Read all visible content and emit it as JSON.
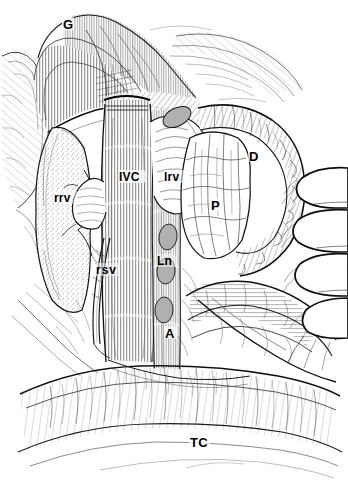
{
  "figure": {
    "kind": "anatomical-line-drawing",
    "background_color": "#ffffff",
    "ink_color": "#000000",
    "node_fill_color": "#b0b0b0",
    "width": 348,
    "height": 493
  },
  "labels": [
    {
      "id": "gonadal-or-gerota",
      "text": "G",
      "x": 66,
      "y": 25,
      "size": 13,
      "meaning": "retracted tissue flap"
    },
    {
      "id": "ivc",
      "text": "IVC",
      "x": 122,
      "y": 178,
      "size": 12,
      "meaning": "inferior vena cava"
    },
    {
      "id": "left-renal-vein",
      "text": "lrv",
      "x": 167,
      "y": 178,
      "size": 12,
      "meaning": "left renal vein"
    },
    {
      "id": "right-renal-vein",
      "text": "rrv",
      "x": 57,
      "y": 199,
      "size": 12,
      "meaning": "right renal vein"
    },
    {
      "id": "right-spermatic-vein",
      "text": "rsv",
      "x": 99,
      "y": 271,
      "size": 12,
      "meaning": "right spermatic vein"
    },
    {
      "id": "lymph-node",
      "text": "Ln",
      "x": 160,
      "y": 262,
      "size": 12,
      "meaning": "lymph node"
    },
    {
      "id": "aorta",
      "text": "A",
      "x": 168,
      "y": 334,
      "size": 13,
      "meaning": "aorta"
    },
    {
      "id": "pancreas",
      "text": "P",
      "x": 214,
      "y": 206,
      "size": 13,
      "meaning": "pancreas"
    },
    {
      "id": "duodenum",
      "text": "D",
      "x": 252,
      "y": 157,
      "size": 13,
      "meaning": "duodenum"
    },
    {
      "id": "transverse-colon",
      "text": "TC",
      "x": 193,
      "y": 443,
      "size": 13,
      "meaning": "transverse colon"
    }
  ],
  "structures": [
    {
      "id": "ivc-trunk",
      "name": "inferior vena cava",
      "shading": "vertical-hatch"
    },
    {
      "id": "aorta-trunk",
      "name": "aorta",
      "shading": "vertical-hatch"
    },
    {
      "id": "right-kidney",
      "name": "right kidney",
      "shading": "stipple"
    },
    {
      "id": "pancreas-body",
      "name": "pancreas",
      "shading": "lobulated-outline"
    },
    {
      "id": "duodenum-loop",
      "name": "duodenum",
      "shading": "cross-hatch"
    },
    {
      "id": "transverse-colon-band",
      "name": "transverse colon",
      "shading": "light-hatch"
    },
    {
      "id": "retractor-hand",
      "name": "retracting fingers",
      "shading": "outline"
    },
    {
      "id": "tissue-flap",
      "name": "retracted tissue flap",
      "shading": "dense-hatch"
    }
  ],
  "lymph_nodes": [
    {
      "id": "ln-upper",
      "cx": 177,
      "cy": 117,
      "rx": 15,
      "ry": 9,
      "rot": -28
    },
    {
      "id": "ln-a",
      "cx": 168,
      "cy": 237,
      "rx": 9,
      "ry": 13,
      "rot": 8
    },
    {
      "id": "ln-b",
      "cx": 166,
      "cy": 271,
      "rx": 9,
      "ry": 13,
      "rot": 5
    },
    {
      "id": "ln-c",
      "cx": 164,
      "cy": 310,
      "rx": 9,
      "ry": 13,
      "rot": 3
    }
  ]
}
